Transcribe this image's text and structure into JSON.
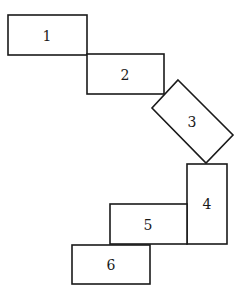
{
  "diagram": {
    "stroke_color": "#1a1a1a",
    "background_color": "#ffffff",
    "boxes": [
      {
        "id": 1,
        "label": "1"
      },
      {
        "id": 2,
        "label": "2"
      },
      {
        "id": 3,
        "label": "3"
      },
      {
        "id": 4,
        "label": "4"
      },
      {
        "id": 5,
        "label": "5"
      },
      {
        "id": 6,
        "label": "6"
      }
    ]
  }
}
